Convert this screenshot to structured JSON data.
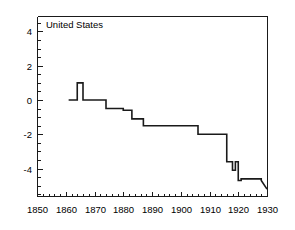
{
  "chart_data": {
    "type": "line",
    "title": "United States",
    "xlabel": "",
    "ylabel": "",
    "xlim": [
      1850,
      1930
    ],
    "ylim": [
      -5.6,
      4.9
    ],
    "grid": false,
    "legend": "none",
    "x_ticks": [
      1850,
      1860,
      1870,
      1880,
      1890,
      1900,
      1910,
      1920,
      1930
    ],
    "x_tick_labels": [
      "1850",
      "1860",
      "1870",
      "1880",
      "1890",
      "1900",
      "1910",
      "1920",
      "1930"
    ],
    "x_minor_step": 2,
    "y_ticks": [
      4,
      2,
      0,
      -2,
      -4
    ],
    "y_tick_labels": [
      "4",
      "2",
      "0",
      "-2",
      "-4"
    ],
    "y_minor_step": 0.5,
    "series": [
      {
        "name": "United States",
        "style": "step",
        "color": "#1a1a1a",
        "x": [
          1861,
          1864,
          1864,
          1866,
          1866,
          1874,
          1874,
          1880,
          1880,
          1883,
          1883,
          1887,
          1887,
          1906,
          1906,
          1916,
          1916,
          1918,
          1918,
          1919,
          1919,
          1920,
          1920,
          1921,
          1921,
          1928,
          1928,
          1930
        ],
        "y": [
          0,
          0,
          1,
          1,
          0,
          0,
          -0.5,
          -0.5,
          -0.6,
          -0.6,
          -1.1,
          -1.1,
          -1.5,
          -1.5,
          -2,
          -2,
          -3.6,
          -3.6,
          -4.1,
          -4.1,
          -3.6,
          -3.6,
          -4.7,
          -4.7,
          -4.6,
          -4.6,
          -4.7,
          -5.2
        ]
      }
    ]
  },
  "plot_box": {
    "left": 37,
    "right": 267,
    "top": 16,
    "bottom": 196
  }
}
